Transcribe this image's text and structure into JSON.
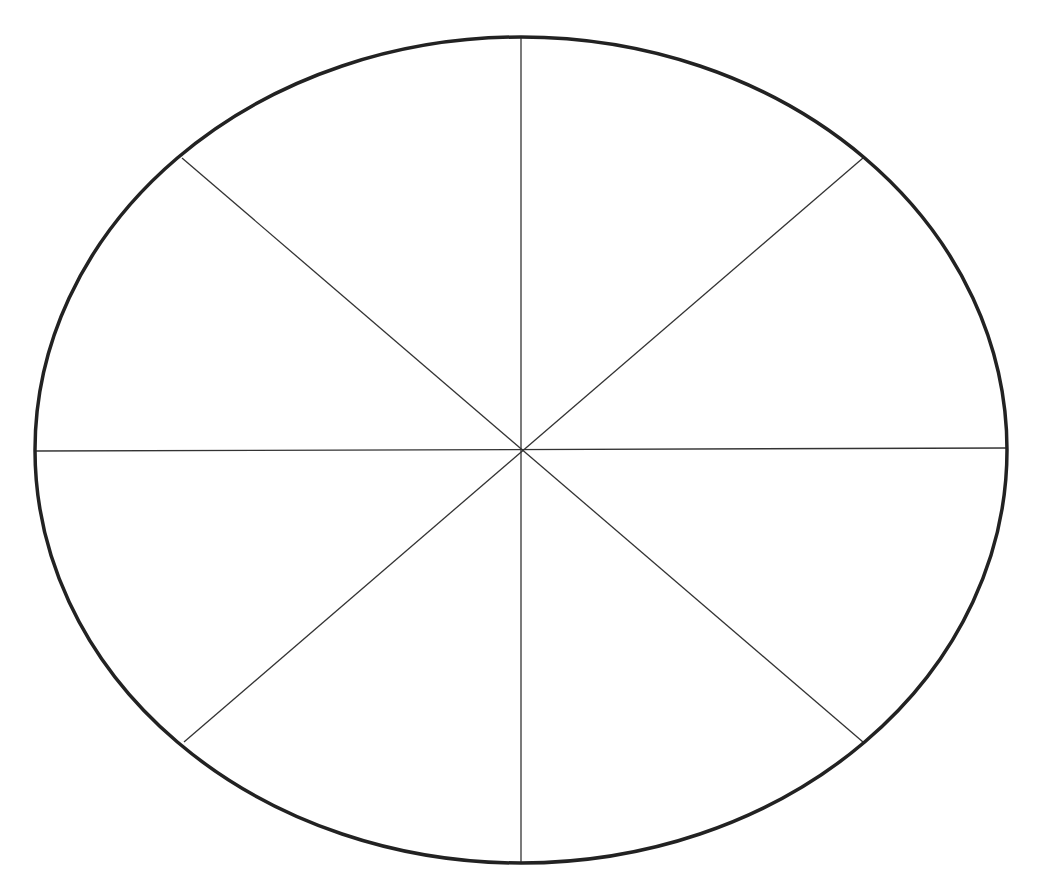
{
  "diagram": {
    "type": "segmented-ellipse",
    "segments": 8,
    "ellipse": {
      "cx": 521,
      "cy": 450,
      "rx": 486,
      "ry": 413
    },
    "colors": {
      "background": "#ffffff",
      "outline": "#222222",
      "dividers": "#333333"
    },
    "dividers": [
      {
        "name": "vertical",
        "x1": 521,
        "y1": 37,
        "x2": 521,
        "y2": 863
      },
      {
        "name": "horizontal",
        "x1": 35,
        "y1": 451,
        "x2": 1007,
        "y2": 448
      },
      {
        "name": "diagonal-down",
        "x1": 182,
        "y1": 158,
        "x2": 863,
        "y2": 742
      },
      {
        "name": "diagonal-up",
        "x1": 863,
        "y1": 158,
        "x2": 184,
        "y2": 742
      }
    ]
  }
}
